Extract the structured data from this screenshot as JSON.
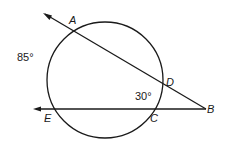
{
  "diagram": {
    "type": "geometry-circle-secants",
    "stroke_color": "#1a1a1a",
    "background": "#ffffff",
    "circle": {
      "cx": 105,
      "cy": 80,
      "r": 58
    },
    "points": {
      "A": {
        "label": "A",
        "x": 73,
        "y": 30
      },
      "D": {
        "label": "D",
        "x": 162,
        "y": 88
      },
      "C": {
        "label": "C",
        "x": 153,
        "y": 109
      },
      "E": {
        "label": "E",
        "x": 56,
        "y": 109
      },
      "B": {
        "label": "B",
        "x": 206,
        "y": 109
      }
    },
    "rays": [
      {
        "name": "secant-BA",
        "from": "B",
        "through": [
          "D",
          "A"
        ],
        "arrow_end": {
          "x": 43,
          "y": 13
        }
      },
      {
        "name": "secant-BE",
        "from": "B",
        "through": [
          "C",
          "E"
        ],
        "arrow_end": {
          "x": 33,
          "y": 109
        }
      }
    ],
    "annotations": {
      "arc_AE": "85°",
      "arc_DC": "30°"
    }
  }
}
